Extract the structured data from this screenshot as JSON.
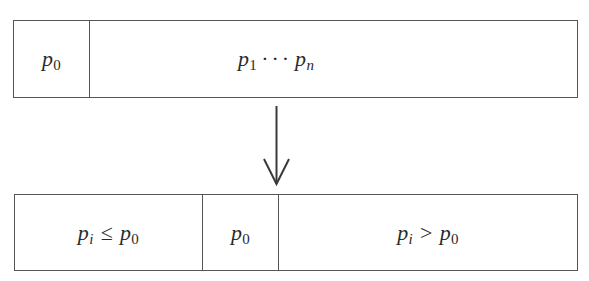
{
  "diagram": {
    "type": "partition-flow",
    "colors": {
      "stroke": "#555555",
      "text": "#2a2a2a",
      "background": "#ffffff"
    },
    "top_array": {
      "cells": [
        {
          "base": "p",
          "sub": "0"
        },
        {
          "start": {
            "base": "p",
            "sub": "1"
          },
          "ellipsis": "···",
          "end": {
            "base": "p",
            "sub": "n"
          }
        }
      ]
    },
    "arrow": {
      "direction": "down",
      "icon": "down-arrow-icon"
    },
    "bottom_array": {
      "cells": [
        {
          "lhs": {
            "base": "p",
            "sub": "i"
          },
          "op": "≤",
          "rhs": {
            "base": "p",
            "sub": "0"
          }
        },
        {
          "base": "p",
          "sub": "0"
        },
        {
          "lhs": {
            "base": "p",
            "sub": "i"
          },
          "op": ">",
          "rhs": {
            "base": "p",
            "sub": "0"
          }
        }
      ]
    }
  }
}
